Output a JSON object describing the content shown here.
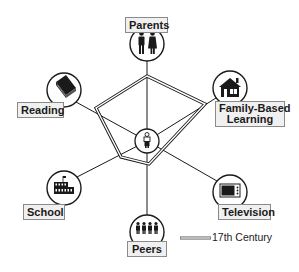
{
  "diagram": {
    "center": {
      "icon": "child-icon"
    },
    "nodes": [
      {
        "id": "parents",
        "label": "Parents",
        "icon": "parents-icon"
      },
      {
        "id": "reading",
        "label": "Reading",
        "icon": "book-icon"
      },
      {
        "id": "family",
        "label_line1": "Family-Based",
        "label_line2": "Learning",
        "icon": "house-icon"
      },
      {
        "id": "school",
        "label": "School",
        "icon": "school-building-icon"
      },
      {
        "id": "television",
        "label": "Television",
        "icon": "tv-icon"
      },
      {
        "id": "peers",
        "label": "Peers",
        "icon": "peers-group-icon"
      }
    ],
    "series": [
      {
        "name": "17th Century",
        "style": "double-line"
      }
    ],
    "legend": {
      "label": "17th Century"
    },
    "colors": {
      "line": "#1a1a1a",
      "label_fill": "#f0f0f0",
      "label_border": "#8a8a8a"
    }
  }
}
